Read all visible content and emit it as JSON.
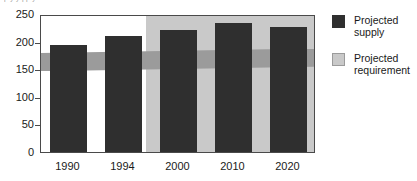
{
  "top_caption": "p          y            y  pp y",
  "chart_data": {
    "type": "bar",
    "title": "",
    "xlabel": "",
    "ylabel": "",
    "categories": [
      "1990",
      "1994",
      "2000",
      "2010",
      "2020"
    ],
    "series": [
      {
        "name": "Projected supply",
        "color": "#2f2f2f",
        "values": [
          193,
          210,
          221,
          234,
          226
        ]
      }
    ],
    "bands": [
      {
        "name": "Projected requirement",
        "color": "#c9c9c9",
        "band_color": "#9b9b9b",
        "start_category": "2000",
        "value_low_left": 150,
        "value_high_left": 183,
        "value_low_right": 158,
        "value_high_right": 191
      }
    ],
    "ylim": [
      0,
      250
    ],
    "yticks": [
      0,
      50,
      100,
      150,
      200,
      250
    ],
    "ytick_labels": [
      "0",
      "50",
      "100",
      "150",
      "200",
      "250"
    ],
    "grid": false,
    "legend_position": "right"
  },
  "legend": {
    "items": [
      {
        "label": "Projected\nsupply",
        "swatch": "supply"
      },
      {
        "label": "Projected\nrequirement",
        "swatch": "requirement"
      }
    ]
  }
}
